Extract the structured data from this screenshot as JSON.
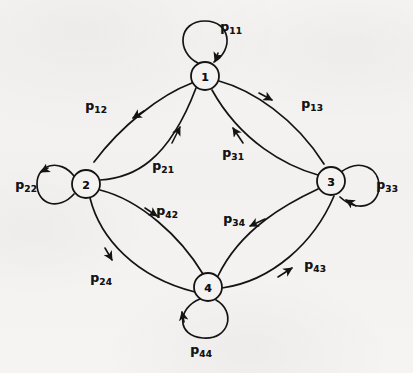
{
  "figure": {
    "type": "state-transition-diagram",
    "background_color": "#f4f3f1",
    "ink_color": "#141414",
    "width": 413,
    "height": 373
  },
  "nodes": [
    {
      "id": "1",
      "label": "1",
      "cx": 205,
      "cy": 76,
      "r": 14
    },
    {
      "id": "2",
      "label": "2",
      "cx": 86,
      "cy": 184,
      "r": 14
    },
    {
      "id": "3",
      "label": "3",
      "cx": 331,
      "cy": 181,
      "r": 14
    },
    {
      "id": "4",
      "label": "4",
      "cx": 208,
      "cy": 287,
      "r": 14
    }
  ],
  "self_loops": [
    {
      "id": "p11",
      "from": "1",
      "to": "1",
      "label": "p",
      "sub": "11",
      "label_x": 231,
      "label_y": 27,
      "direction": "up"
    },
    {
      "id": "p22",
      "from": "2",
      "to": "2",
      "label": "p",
      "sub": "22",
      "label_x": 26,
      "label_y": 185,
      "direction": "left"
    },
    {
      "id": "p33",
      "from": "3",
      "to": "3",
      "label": "p",
      "sub": "33",
      "label_x": 387,
      "label_y": 185,
      "direction": "right"
    },
    {
      "id": "p44",
      "from": "4",
      "to": "4",
      "label": "p",
      "sub": "44",
      "label_x": 201,
      "label_y": 350,
      "direction": "down"
    }
  ],
  "edges": [
    {
      "id": "p12",
      "from": "1",
      "to": "2",
      "label": "p",
      "sub": "12",
      "label_x": 96,
      "label_y": 106,
      "arc": "outer-upper-left"
    },
    {
      "id": "p13",
      "from": "1",
      "to": "3",
      "label": "p",
      "sub": "13",
      "label_x": 312,
      "label_y": 104,
      "arc": "outer-upper-right"
    },
    {
      "id": "p21",
      "from": "2",
      "to": "1",
      "label": "p",
      "sub": "21",
      "label_x": 163,
      "label_y": 166,
      "arc": "inner-upper-left"
    },
    {
      "id": "p31",
      "from": "3",
      "to": "1",
      "label": "p",
      "sub": "31",
      "label_x": 233,
      "label_y": 153,
      "arc": "inner-upper-right"
    },
    {
      "id": "p42",
      "from": "4",
      "to": "2",
      "label": "p",
      "sub": "42",
      "label_x": 167,
      "label_y": 211,
      "arc": "inner-lower-left"
    },
    {
      "id": "p34",
      "from": "3",
      "to": "4",
      "label": "p",
      "sub": "34",
      "label_x": 234,
      "label_y": 219,
      "arc": "inner-lower-right"
    },
    {
      "id": "p24",
      "from": "2",
      "to": "4",
      "label": "p",
      "sub": "24",
      "label_x": 101,
      "label_y": 278,
      "arc": "outer-lower-left"
    },
    {
      "id": "p43",
      "from": "4",
      "to": "3",
      "label": "p",
      "sub": "43",
      "label_x": 315,
      "label_y": 265,
      "arc": "outer-lower-right"
    }
  ]
}
